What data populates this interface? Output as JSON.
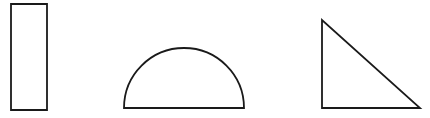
{
  "canvas": {
    "width": 430,
    "height": 118,
    "background_color": "#ffffff",
    "title": "Geometric Shapes"
  },
  "style": {
    "stroke_color": "#1a1a1a",
    "stroke_width": 1.8,
    "fill": "none"
  },
  "shapes": [
    {
      "id": "rectangle",
      "name": "rectangle",
      "type": "rect",
      "label": "Rectangle",
      "x": 11,
      "y": 4,
      "width": 36,
      "height": 106,
      "stroke_color": "#1a1a1a",
      "fill": "none"
    },
    {
      "id": "semicircle",
      "name": "semicircle",
      "type": "semicircle",
      "label": "Semicircle",
      "center_x": 184,
      "base_y": 108,
      "radius": 60,
      "left_x": 124,
      "right_x": 244,
      "apex_y": 48,
      "path": "M 124 108 A 60 60 0 0 1 244 108 Z",
      "stroke_color": "#1a1a1a",
      "fill": "none"
    },
    {
      "id": "right-triangle",
      "name": "right-triangle",
      "type": "triangle",
      "label": "Right Triangle",
      "points": "322,20 322,108 420,108",
      "vertices": [
        {
          "x": 322,
          "y": 20
        },
        {
          "x": 322,
          "y": 108
        },
        {
          "x": 420,
          "y": 108
        }
      ],
      "right_angle_vertex": {
        "x": 322,
        "y": 108
      },
      "stroke_color": "#1a1a1a",
      "fill": "none"
    }
  ]
}
